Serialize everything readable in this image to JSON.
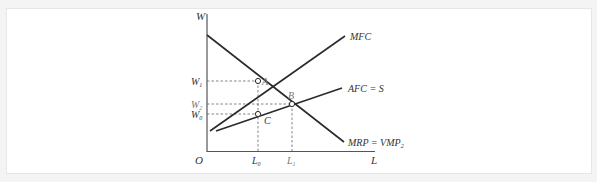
{
  "diagram": {
    "axes": {
      "y_label": "W",
      "x_label": "L",
      "origin_label": "O"
    },
    "curves": {
      "mfc": {
        "label": "MFC"
      },
      "afc": {
        "label": "AFC = S"
      },
      "mrp": {
        "label": "MRP = VMP",
        "subscript": "2"
      }
    },
    "points": {
      "a": {
        "label": "A"
      },
      "b": {
        "label": "B"
      },
      "c": {
        "label": "C"
      }
    },
    "y_ticks": {
      "w1": {
        "label": "W",
        "subscript": "1"
      },
      "w2": {
        "label": "W",
        "subscript": "2"
      },
      "w0": {
        "label": "W",
        "subscript": "0"
      }
    },
    "x_ticks": {
      "l0": {
        "label": "L",
        "subscript": "0"
      },
      "l1": {
        "label": "L",
        "subscript": "1"
      }
    },
    "colors": {
      "line": "#2a2a2a",
      "axis": "#555555",
      "dashed": "#666666",
      "text": "#333333",
      "muted_text": "#777777"
    }
  }
}
